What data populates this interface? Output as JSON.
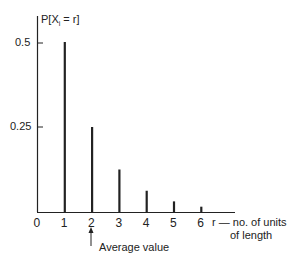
{
  "chart_data": {
    "type": "bar",
    "title": "",
    "ylabel": "P[X_i = r]",
    "xlabel": "r — no. of units of length",
    "x": [
      1,
      2,
      3,
      4,
      5,
      6
    ],
    "values": [
      0.5,
      0.25,
      0.125,
      0.0625,
      0.03125,
      0.015625
    ],
    "x_ticks": [
      "0",
      "1",
      "2",
      "3",
      "4",
      "5",
      "6"
    ],
    "y_ticks": [
      "0.25",
      "0.5"
    ],
    "ylim": [
      0,
      0.55
    ],
    "xlim": [
      0,
      8.5
    ],
    "grid": false,
    "annotations": [
      {
        "text": "Average value",
        "x": 2,
        "arrow": true
      }
    ]
  },
  "labels": {
    "ylabel_p": "P[X",
    "ylabel_sub": "i",
    "ylabel_rest": " = r]",
    "y_tick_05": "0.5",
    "y_tick_025": "0.25",
    "xlabel_line1": "r —  no. of units",
    "xlabel_line2": "of length",
    "annotation": "Average value"
  }
}
